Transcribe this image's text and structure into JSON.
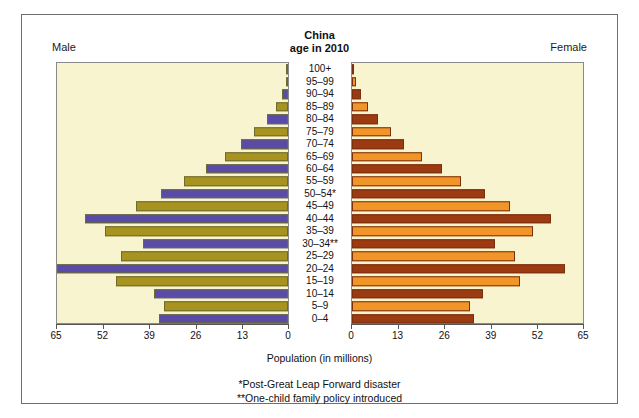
{
  "chart_data": {
    "type": "bar",
    "subtype": "population-pyramid",
    "title": "China",
    "subtitle": "age in 2010",
    "xlabel": "Population (in millions)",
    "ylabel": "",
    "xlim": [
      0,
      65
    ],
    "xticks": [
      0,
      13,
      26,
      39,
      52,
      65
    ],
    "left_axis_ticks": [
      "65",
      "52",
      "39",
      "26",
      "13",
      "0"
    ],
    "right_axis_ticks": [
      "0",
      "13",
      "26",
      "39",
      "52",
      "65"
    ],
    "grid": false,
    "legend_position": "none",
    "categories": [
      "100+",
      "95–99",
      "90–94",
      "85–89",
      "80–84",
      "75–79",
      "70–74",
      "65–69",
      "60–64",
      "55–59",
      "50–54*",
      "45–49",
      "40–44",
      "35–39",
      "30–34**",
      "25–29",
      "20–24",
      "15–19",
      "10–14",
      "5–9",
      "0–4"
    ],
    "series": [
      {
        "name": "Male",
        "side": "left",
        "values": [
          0.04,
          0.6,
          1.6,
          3.4,
          6.0,
          9.5,
          13.0,
          17.5,
          23.0,
          29.0,
          35.5,
          42.5,
          56.5,
          51.0,
          40.5,
          46.5,
          64.5,
          48.0,
          37.5,
          34.5,
          36.0
        ]
      },
      {
        "name": "Female",
        "side": "right",
        "values": [
          0.09,
          1.0,
          2.4,
          4.6,
          7.2,
          11.0,
          14.5,
          19.5,
          25.0,
          30.5,
          37.0,
          44.0,
          55.5,
          50.5,
          40.0,
          45.5,
          59.5,
          47.0,
          36.5,
          33.0,
          34.0
        ]
      }
    ],
    "colors": {
      "male_a": "#5b4ba8",
      "male_b": "#a89220",
      "female_a": "#9c3a12",
      "female_b": "#f29528",
      "plot_background": "#f7f4cf",
      "frame": "#6f6f6f",
      "text": "#111111"
    },
    "annotations": [
      "*Post-Great Leap Forward disaster",
      "**One-child family policy introduced"
    ]
  },
  "header": {
    "male_label": "Male",
    "female_label": "Female",
    "title": "China",
    "subtitle": "age in 2010"
  },
  "footer": {
    "axis_title": "Population (in millions)",
    "note_1": "*Post-Great Leap Forward disaster",
    "note_2": "**One-child family policy introduced"
  }
}
